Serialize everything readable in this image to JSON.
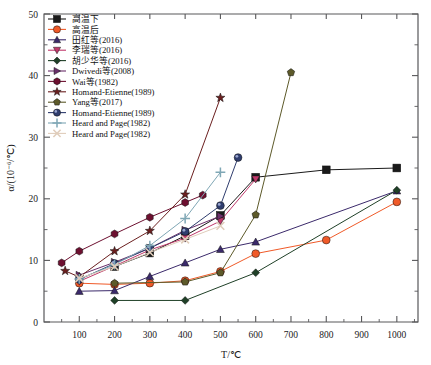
{
  "chart_data": {
    "type": "line",
    "title": "",
    "xlabel": "T/℃",
    "ylabel": "α/(10⁻⁶/℃)",
    "xlim": [
      0,
      1060
    ],
    "ylim": [
      0,
      50
    ],
    "xticks": [
      100,
      200,
      300,
      400,
      500,
      600,
      700,
      800,
      900,
      1000
    ],
    "yticks": [
      0,
      10,
      20,
      30,
      40,
      50
    ],
    "yminor": [
      5,
      15,
      25,
      35,
      45
    ],
    "grid": false,
    "legend_position": "top-left",
    "series": [
      {
        "name": "高温下",
        "color": "#1a1a1a",
        "marker": "square",
        "x": [
          200,
          300,
          400,
          500,
          600,
          800,
          1000
        ],
        "y": [
          9.0,
          11.2,
          14.0,
          17.3,
          23.5,
          24.7,
          25.0
        ]
      },
      {
        "name": "高温后",
        "color": "#f05a28",
        "marker": "circle",
        "x": [
          100,
          200,
          300,
          400,
          500,
          600,
          800,
          1000
        ],
        "y": [
          6.3,
          6.1,
          6.3,
          6.7,
          8.2,
          11.1,
          13.3,
          19.5
        ]
      },
      {
        "name": "田红等(2016)",
        "color": "#3b2a6b",
        "marker": "triangle-up",
        "x": [
          100,
          200,
          300,
          400,
          500,
          600,
          1000
        ],
        "y": [
          5.0,
          5.1,
          7.4,
          9.6,
          11.8,
          13.0,
          21.3
        ]
      },
      {
        "name": "李瑞等(2016)",
        "color": "#c0396b",
        "marker": "triangle-down",
        "x": [
          100,
          200,
          300,
          400,
          500,
          600
        ],
        "y": [
          6.6,
          9.1,
          11.7,
          13.6,
          16.4,
          23.2
        ]
      },
      {
        "name": "胡少华等(2016)",
        "color": "#1f4027",
        "marker": "diamond",
        "x": [
          200,
          400,
          600,
          1000
        ],
        "y": [
          3.5,
          3.5,
          8.0,
          21.4
        ]
      },
      {
        "name": "Dwivedi等(2008)",
        "color": "#6b2f6b",
        "marker": "triangle-right",
        "x": [
          100,
          200,
          300,
          400,
          500
        ],
        "y": [
          7.6,
          9.7,
          12.0,
          14.9,
          17.2
        ]
      },
      {
        "name": "Wai等(1982)",
        "color": "#6d1030",
        "marker": "hexagon",
        "x": [
          50,
          100,
          200,
          300,
          400,
          450
        ],
        "y": [
          9.6,
          11.5,
          14.3,
          17.0,
          19.4,
          20.6
        ]
      },
      {
        "name": "Homand-Etienne(1989)",
        "color": "#6b1f1f",
        "marker": "star",
        "x": [
          60,
          100,
          200,
          300,
          400,
          500
        ],
        "y": [
          8.3,
          7.3,
          11.5,
          14.8,
          20.7,
          36.4
        ]
      },
      {
        "name": "Yang等(2017)",
        "color": "#5d5a2a",
        "marker": "pentagon",
        "x": [
          200,
          400,
          500,
          600,
          700
        ],
        "y": [
          6.3,
          6.5,
          8.0,
          17.4,
          40.5
        ]
      },
      {
        "name": "Homand-Etienne(1989)",
        "color": "#2f3d6e",
        "marker": "circle-3d",
        "x": [
          100,
          200,
          300,
          400,
          500,
          550
        ],
        "y": [
          6.9,
          9.5,
          12.0,
          14.7,
          18.9,
          26.7
        ]
      },
      {
        "name": "Heard and Page(1982)",
        "color": "#7fa7b5",
        "marker": "plus",
        "x": [
          100,
          200,
          300,
          400,
          500
        ],
        "y": [
          7.0,
          9.3,
          12.4,
          16.8,
          24.3
        ]
      },
      {
        "name": "Heard and Page(1982)",
        "color": "#e0cdbb",
        "marker": "cross",
        "x": [
          100,
          200,
          300,
          400,
          500
        ],
        "y": [
          7.1,
          9.0,
          11.3,
          13.4,
          15.6
        ]
      }
    ]
  },
  "legend": {
    "items": [
      {
        "label": "高温下"
      },
      {
        "label": "高温后"
      },
      {
        "label": "田红等(2016)"
      },
      {
        "label": "李瑞等(2016)"
      },
      {
        "label": "胡少华等(2016)"
      },
      {
        "label": "Dwivedi等(2008)"
      },
      {
        "label": "Wai等(1982)"
      },
      {
        "label": "Homand-Etienne(1989)"
      },
      {
        "label": "Yang等(2017)"
      },
      {
        "label": "Homand-Etienne(1989)"
      },
      {
        "label": "Heard and Page(1982)"
      },
      {
        "label": "Heard and Page(1982)"
      }
    ]
  },
  "axes": {
    "xlabel": "T/℃",
    "ylabel": "α/(10⁻⁶/℃)",
    "xticklabels": [
      "100",
      "200",
      "300",
      "400",
      "500",
      "600",
      "700",
      "800",
      "900",
      "1000"
    ],
    "yticklabels": [
      "0",
      "10",
      "20",
      "30",
      "40",
      "50"
    ]
  }
}
